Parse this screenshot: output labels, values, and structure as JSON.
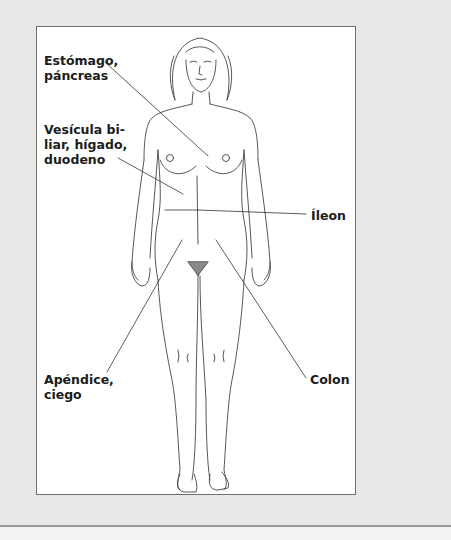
{
  "figure": {
    "type": "anatomical-illustration",
    "labels": [
      {
        "id": "estomago",
        "text": "Estómago,\npáncreas",
        "x": 44,
        "y": 53
      },
      {
        "id": "vesicula",
        "text": "Vesícula bi-\nliar, hígado,\nduodeno",
        "x": 44,
        "y": 122
      },
      {
        "id": "ileon",
        "text": "Íleon",
        "x": 311,
        "y": 208
      },
      {
        "id": "apendice",
        "text": "Apéndice,\nciego",
        "x": 44,
        "y": 372
      },
      {
        "id": "colon",
        "text": "Colon",
        "x": 310,
        "y": 372
      }
    ],
    "colors": {
      "box_border": "#6e6e6e",
      "line": "#333333",
      "text": "#1c1c1c",
      "background": "#e8e8e6"
    }
  }
}
